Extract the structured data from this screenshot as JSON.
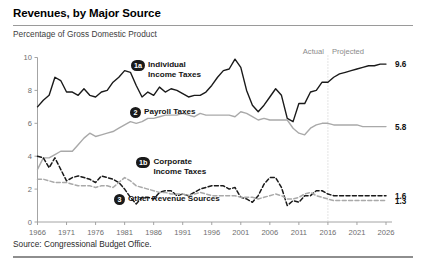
{
  "header": {
    "title": "Revenues, by Major Source",
    "subtitle": "Percentage of Gross Domestic Product"
  },
  "footer": {
    "source": "Source: Congressional Budget Office."
  },
  "annotations": {
    "actual": "Actual",
    "projected": "Projected",
    "divider_year": 2016
  },
  "callouts": [
    {
      "id": "1a",
      "badge": "1a",
      "label": "Individual\nIncome Taxes"
    },
    {
      "id": "2",
      "badge": "2",
      "label": "Payroll Taxes"
    },
    {
      "id": "1b",
      "badge": "1b",
      "label": "Corporate\nIncome Taxes"
    },
    {
      "id": "3",
      "badge": "3",
      "label": "Other Revenue Sources"
    }
  ],
  "endlabels": {
    "individual": "9.6",
    "payroll": "5.8",
    "corporate": "1.6",
    "other": "1.3"
  },
  "colors": {
    "individual": "#1a1a1a",
    "payroll": "#a9a9a9",
    "corporate": "#1a1a1a",
    "other": "#a9a9a9",
    "axis": "#9a9a9a",
    "divider": "#c9c9c9",
    "badge": "#1a1a1a"
  },
  "chart_data": {
    "type": "line",
    "title": "Revenues, by Major Source",
    "subtitle": "Percentage of Gross Domestic Product",
    "xlabel": "",
    "ylabel": "Percentage of Gross Domestic Product",
    "xlim": [
      1966,
      2026
    ],
    "ylim": [
      0,
      10
    ],
    "yticks": [
      0,
      2,
      4,
      6,
      8,
      10
    ],
    "xticks": [
      1966,
      1971,
      1976,
      1981,
      1986,
      1991,
      1996,
      2001,
      2006,
      2011,
      2016,
      2021,
      2026
    ],
    "grid": false,
    "legend": "inline-callouts",
    "actual_through": 2016,
    "x": [
      1966,
      1967,
      1968,
      1969,
      1970,
      1971,
      1972,
      1973,
      1974,
      1975,
      1976,
      1977,
      1978,
      1979,
      1980,
      1981,
      1982,
      1983,
      1984,
      1985,
      1986,
      1987,
      1988,
      1989,
      1990,
      1991,
      1992,
      1993,
      1994,
      1995,
      1996,
      1997,
      1998,
      1999,
      2000,
      2001,
      2002,
      2003,
      2004,
      2005,
      2006,
      2007,
      2008,
      2009,
      2010,
      2011,
      2012,
      2013,
      2014,
      2015,
      2016,
      2017,
      2018,
      2019,
      2020,
      2021,
      2022,
      2023,
      2024,
      2025,
      2026
    ],
    "series": [
      {
        "name": "Individual Income Taxes",
        "key": "individual",
        "style": "solid",
        "color": "#1a1a1a",
        "end_value": 9.6,
        "values": [
          7.0,
          7.4,
          7.7,
          8.8,
          8.6,
          7.9,
          7.9,
          7.7,
          8.1,
          7.7,
          7.6,
          7.9,
          8.0,
          8.5,
          8.8,
          9.2,
          9.1,
          8.3,
          7.6,
          7.9,
          7.7,
          8.2,
          7.9,
          8.1,
          8.0,
          7.8,
          7.6,
          7.7,
          7.7,
          7.9,
          8.3,
          8.8,
          9.2,
          9.3,
          9.9,
          9.4,
          8.0,
          7.1,
          6.7,
          7.1,
          7.6,
          8.1,
          7.7,
          6.3,
          6.1,
          7.2,
          7.2,
          7.9,
          8.0,
          8.5,
          8.5,
          8.8,
          9.0,
          9.1,
          9.2,
          9.3,
          9.4,
          9.5,
          9.5,
          9.6,
          9.6
        ]
      },
      {
        "name": "Payroll Taxes",
        "key": "payroll",
        "style": "solid",
        "color": "#a9a9a9",
        "end_value": 5.8,
        "values": [
          3.2,
          3.9,
          3.9,
          4.1,
          4.3,
          4.3,
          4.3,
          4.7,
          5.1,
          5.4,
          5.2,
          5.3,
          5.4,
          5.5,
          5.7,
          5.9,
          6.1,
          6.0,
          6.1,
          6.3,
          6.3,
          6.4,
          6.5,
          6.5,
          6.5,
          6.6,
          6.5,
          6.4,
          6.6,
          6.5,
          6.5,
          6.5,
          6.5,
          6.5,
          6.4,
          6.7,
          6.6,
          6.4,
          6.2,
          6.3,
          6.2,
          6.2,
          6.2,
          6.2,
          5.7,
          5.4,
          5.3,
          5.7,
          5.9,
          6.0,
          6.0,
          5.9,
          5.9,
          5.9,
          5.9,
          5.9,
          5.8,
          5.8,
          5.8,
          5.8,
          5.8
        ]
      },
      {
        "name": "Corporate Income Taxes",
        "key": "corporate",
        "style": "dashed",
        "color": "#1a1a1a",
        "end_value": 1.6,
        "values": [
          4.0,
          3.9,
          3.3,
          3.9,
          3.2,
          2.5,
          2.7,
          2.8,
          2.7,
          2.6,
          2.4,
          2.8,
          2.7,
          2.6,
          2.4,
          2.0,
          1.5,
          1.1,
          1.5,
          1.5,
          1.4,
          1.8,
          1.9,
          1.9,
          1.6,
          1.7,
          1.6,
          1.8,
          2.0,
          2.1,
          2.2,
          2.2,
          2.2,
          2.0,
          2.1,
          1.5,
          1.4,
          1.2,
          1.6,
          2.3,
          2.7,
          2.7,
          2.1,
          1.0,
          1.3,
          1.2,
          1.6,
          1.6,
          1.9,
          1.9,
          1.7,
          1.6,
          1.6,
          1.6,
          1.6,
          1.6,
          1.6,
          1.6,
          1.6,
          1.6,
          1.6
        ]
      },
      {
        "name": "Other Revenue Sources",
        "key": "other",
        "style": "dashed",
        "color": "#a9a9a9",
        "end_value": 1.3,
        "values": [
          2.6,
          2.6,
          2.5,
          2.4,
          2.4,
          2.4,
          2.3,
          2.2,
          2.2,
          2.2,
          2.1,
          2.2,
          2.2,
          2.1,
          2.4,
          2.7,
          2.5,
          2.2,
          2.1,
          2.0,
          1.9,
          1.8,
          1.8,
          1.7,
          1.7,
          1.7,
          1.6,
          1.7,
          1.8,
          1.7,
          1.6,
          1.6,
          1.6,
          1.6,
          1.6,
          1.5,
          1.5,
          1.5,
          1.4,
          1.5,
          1.6,
          1.7,
          1.6,
          1.4,
          1.4,
          1.5,
          1.7,
          1.8,
          1.6,
          1.5,
          1.4,
          1.3,
          1.3,
          1.3,
          1.3,
          1.3,
          1.3,
          1.3,
          1.3,
          1.3,
          1.3
        ]
      }
    ]
  }
}
